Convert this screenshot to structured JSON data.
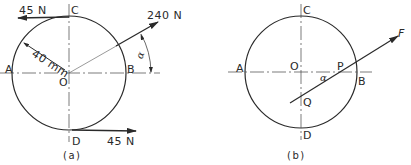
{
  "figure_a": {
    "caption": "(a)",
    "points": {
      "A": "A",
      "B": "B",
      "C": "C",
      "D": "D",
      "O": "O"
    },
    "forces": {
      "top": "45 N",
      "bottom": "45 N",
      "inclined": "240 N"
    },
    "radius_label": "40 mm",
    "angle_label": "α"
  },
  "figure_b": {
    "caption": "(b)",
    "points": {
      "A": "A",
      "B": "B",
      "C": "C",
      "D": "D",
      "O": "O",
      "P": "P",
      "Q": "Q"
    },
    "force_label": "F",
    "angle_label": "α"
  },
  "colors": {
    "ink": "#2a2a2a",
    "background": "#ffffff"
  }
}
